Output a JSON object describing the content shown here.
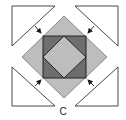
{
  "figure": {
    "label": "C",
    "colors": {
      "outline": "#1a1a1a",
      "light_gray": "#bdbdbd",
      "dark_gray": "#6e6e6e",
      "triangle_fill": "#ffffff"
    },
    "pieces": [
      {
        "name": "corner-triangle-top-left",
        "arrow": "down-right"
      },
      {
        "name": "corner-triangle-top-right",
        "arrow": "down-left"
      },
      {
        "name": "corner-triangle-bottom-left",
        "arrow": "up-right"
      },
      {
        "name": "corner-triangle-bottom-right",
        "arrow": "up-left"
      },
      {
        "name": "outer-diamond",
        "fill": "light_gray"
      },
      {
        "name": "dark-square",
        "fill": "dark_gray"
      },
      {
        "name": "inner-diamond",
        "fill": "light_gray"
      }
    ]
  }
}
